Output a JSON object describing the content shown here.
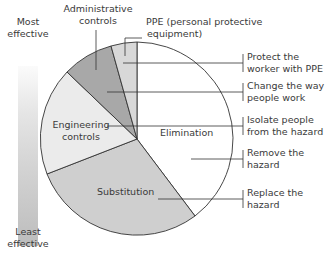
{
  "scale": {
    "top_label_line1": "Most",
    "top_label_line2": "effective",
    "bottom_label_line1": "Least",
    "bottom_label_line2": "effective"
  },
  "segments": {
    "administrative": {
      "line1": "Administrative",
      "line2": "controls",
      "color": "#a9a9a9"
    },
    "ppe": {
      "line1": "PPE (personal protective",
      "line2": "equipment)",
      "color": "#d9d9d9"
    },
    "engineering": {
      "line1": "Engineering",
      "line2": "controls",
      "color": "#ececec"
    },
    "elimination": {
      "label": "Elimination",
      "color": "#ffffff"
    },
    "substitution": {
      "label": "Substitution",
      "color": "#cccccc"
    }
  },
  "descriptions": {
    "ppe": {
      "line1": "Protect the",
      "line2": "worker with PPE"
    },
    "administrative": {
      "line1": "Change the way",
      "line2": "people work"
    },
    "engineering": {
      "line1": "Isolate people",
      "line2": "from the hazard"
    },
    "elimination": {
      "line1": "Remove the",
      "line2": "hazard"
    },
    "substitution": {
      "line1": "Replace the",
      "line2": "hazard"
    }
  }
}
